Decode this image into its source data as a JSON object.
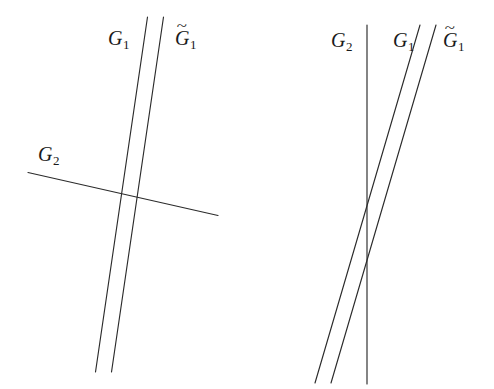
{
  "figure": {
    "background_color": "#ffffff",
    "line_color": "#2b2b2b",
    "text_color": "#1a1a1a",
    "width": 494,
    "height": 389,
    "panels": [
      {
        "id": "left-panel",
        "name": "left-configuration",
        "description": "Two nearly parallel steep lines G1 and G1-tilde crossed by a shallow line G2",
        "lines": [
          {
            "name": "G1",
            "label_base": "G",
            "label_sub": "1",
            "has_tilde": false,
            "x1": 147.5,
            "y1": 17.0,
            "x2": 95.5,
            "y2": 372.0
          },
          {
            "name": "G1tilde",
            "label_base": "G",
            "label_sub": "1",
            "has_tilde": true,
            "x1": 163.5,
            "y1": 17.0,
            "x2": 111.5,
            "y2": 372.0
          },
          {
            "name": "G2",
            "label_base": "G",
            "label_sub": "2",
            "has_tilde": false,
            "x1": 28.0,
            "y1": 172.5,
            "x2": 218.0,
            "y2": 215.5
          }
        ],
        "labels": [
          {
            "name": "label-G1",
            "base": "G",
            "sub": "1",
            "tilde": false,
            "x": 108,
            "y": 28
          },
          {
            "name": "label-G1tilde",
            "base": "G",
            "sub": "1",
            "tilde": true,
            "x": 175,
            "y": 28
          },
          {
            "name": "label-G2",
            "base": "G",
            "sub": "2",
            "tilde": false,
            "x": 38,
            "y": 144
          }
        ]
      },
      {
        "id": "right-panel",
        "name": "right-configuration",
        "description": "A vertical line G2 crossed by two parallel slanted lines G1 and G1-tilde",
        "lines": [
          {
            "name": "G2",
            "label_base": "G",
            "label_sub": "2",
            "has_tilde": false,
            "x1": 367.0,
            "y1": 25.0,
            "x2": 367.0,
            "y2": 384.0
          },
          {
            "name": "G1",
            "label_base": "G",
            "label_sub": "1",
            "has_tilde": false,
            "x1": 420.0,
            "y1": 25.0,
            "x2": 315.0,
            "y2": 383.0
          },
          {
            "name": "G1tilde",
            "label_base": "G",
            "label_sub": "1",
            "has_tilde": true,
            "x1": 436.0,
            "y1": 25.0,
            "x2": 331.0,
            "y2": 383.0
          }
        ],
        "labels": [
          {
            "name": "label-G2",
            "base": "G",
            "sub": "2",
            "tilde": false,
            "x": 331,
            "y": 30
          },
          {
            "name": "label-G1",
            "base": "G",
            "sub": "1",
            "tilde": false,
            "x": 393,
            "y": 30
          },
          {
            "name": "label-G1tilde",
            "base": "G",
            "sub": "1",
            "tilde": true,
            "x": 443,
            "y": 30
          }
        ],
        "intersections": [
          {
            "name": "G1-meets-G2",
            "x": 367,
            "y": 205
          },
          {
            "name": "G1tilde-meets-G2",
            "x": 367,
            "y": 258
          }
        ]
      }
    ],
    "tilde_glyph": "~"
  }
}
